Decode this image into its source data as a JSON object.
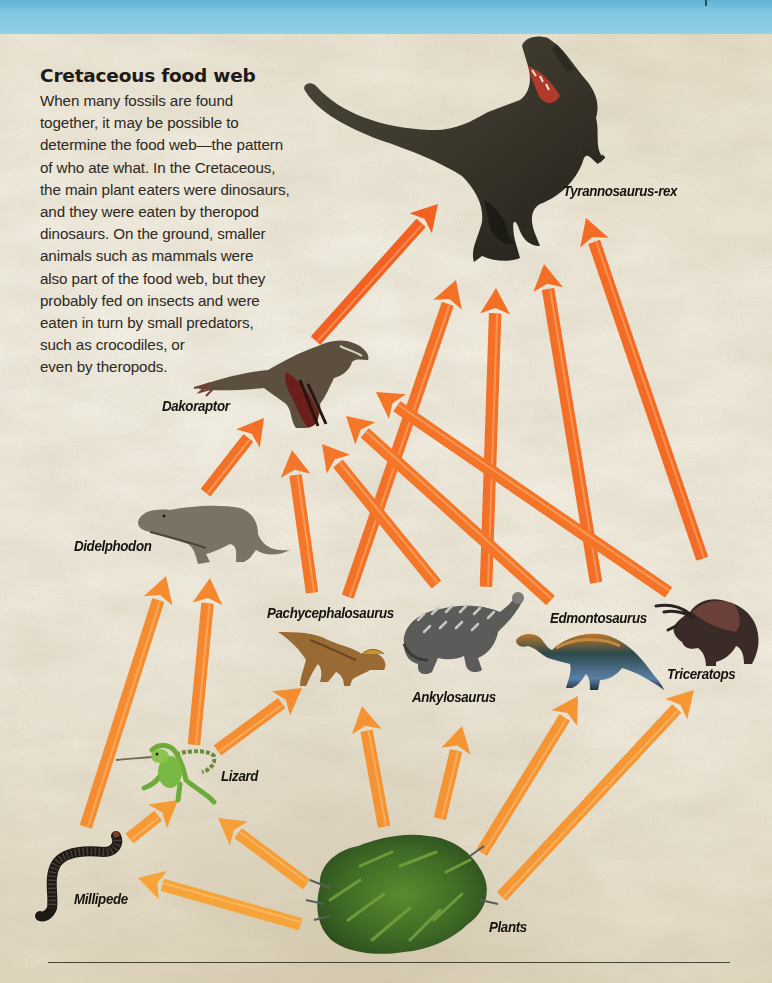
{
  "header": {
    "title": "Cretaceous food web",
    "body_lines": [
      "When many fossils are found",
      "together, it may be possible to",
      "determine the food web—the pattern",
      "of who ate what. In the Cretaceous,",
      "the main plant eaters were dinosaurs,",
      "and they were eaten by theropod",
      "dinosaurs. On the ground, smaller",
      "animals such as mammals were",
      "also part of the food web, but they",
      "probably fed on insects and were",
      "eaten in turn by small predators,",
      "such as crocodiles, or",
      "even by theropods."
    ]
  },
  "organisms": [
    {
      "id": "trex",
      "label": "Tyrannosaurus-rex",
      "icon": "tyrannosaurus-icon"
    },
    {
      "id": "dakoraptor",
      "label": "Dakoraptor",
      "icon": "dakoraptor-icon"
    },
    {
      "id": "didelphodon",
      "label": "Didelphodon",
      "icon": "didelphodon-icon"
    },
    {
      "id": "pachy",
      "label": "Pachycephalosaurus",
      "icon": "pachycephalosaurus-icon"
    },
    {
      "id": "ankylo",
      "label": "Ankylosaurus",
      "icon": "ankylosaurus-icon"
    },
    {
      "id": "edmonto",
      "label": "Edmontosaurus",
      "icon": "edmontosaurus-icon"
    },
    {
      "id": "tricera",
      "label": "Triceratops",
      "icon": "triceratops-icon"
    },
    {
      "id": "lizard",
      "label": "Lizard",
      "icon": "lizard-icon"
    },
    {
      "id": "millipede",
      "label": "Millipede",
      "icon": "millipede-icon"
    },
    {
      "id": "plants",
      "label": "Plants",
      "icon": "fern-plants-icon"
    }
  ],
  "links": [
    {
      "from": "dakoraptor",
      "to": "trex"
    },
    {
      "from": "pachy",
      "to": "trex"
    },
    {
      "from": "ankylo",
      "to": "trex"
    },
    {
      "from": "edmonto",
      "to": "trex"
    },
    {
      "from": "tricera",
      "to": "trex"
    },
    {
      "from": "didelphodon",
      "to": "dakoraptor"
    },
    {
      "from": "pachy",
      "to": "dakoraptor"
    },
    {
      "from": "ankylo",
      "to": "dakoraptor"
    },
    {
      "from": "edmonto",
      "to": "dakoraptor"
    },
    {
      "from": "tricera",
      "to": "dakoraptor"
    },
    {
      "from": "millipede",
      "to": "didelphodon"
    },
    {
      "from": "lizard",
      "to": "didelphodon"
    },
    {
      "from": "lizard",
      "to": "pachy"
    },
    {
      "from": "millipede",
      "to": "lizard"
    },
    {
      "from": "plants",
      "to": "lizard"
    },
    {
      "from": "plants",
      "to": "millipede"
    },
    {
      "from": "plants",
      "to": "pachy"
    },
    {
      "from": "plants",
      "to": "ankylo"
    },
    {
      "from": "plants",
      "to": "edmonto"
    },
    {
      "from": "plants",
      "to": "tricera"
    }
  ],
  "colors": {
    "arrow_top": "#f2591f",
    "arrow_mid": "#f47a2a",
    "arrow_bottom": "#f6a73a",
    "sky": "#7ec6e0",
    "paper": "#f1ebdc",
    "label_text": "#16130f"
  }
}
